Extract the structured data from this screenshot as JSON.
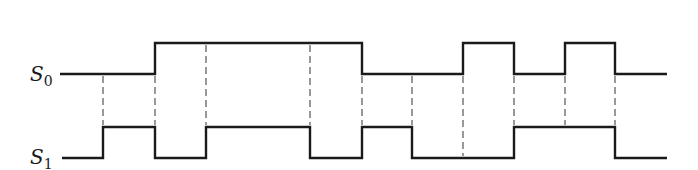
{
  "diagram": {
    "title": "",
    "type": "timing-diagram",
    "colors": {
      "line": "#1a1a1a",
      "dash": "#555555",
      "background": "#ffffff"
    },
    "signals": [
      {
        "id": "s0",
        "label_main": "S",
        "label_sub": "0",
        "y_high": 43,
        "y_low": 74,
        "x_start": 60,
        "x_end": 667,
        "segments": [
          {
            "from": 60,
            "to": 155,
            "level": "low"
          },
          {
            "from": 155,
            "to": 362,
            "level": "high"
          },
          {
            "from": 362,
            "to": 463,
            "level": "low"
          },
          {
            "from": 463,
            "to": 514,
            "level": "high"
          },
          {
            "from": 514,
            "to": 565,
            "level": "low"
          },
          {
            "from": 565,
            "to": 615,
            "level": "high"
          },
          {
            "from": 615,
            "to": 667,
            "level": "low"
          }
        ]
      },
      {
        "id": "s1",
        "label_main": "S",
        "label_sub": "1",
        "y_high": 127,
        "y_low": 158,
        "x_start": 62,
        "x_end": 667,
        "segments": [
          {
            "from": 62,
            "to": 103,
            "level": "low"
          },
          {
            "from": 103,
            "to": 155,
            "level": "high"
          },
          {
            "from": 155,
            "to": 206,
            "level": "low"
          },
          {
            "from": 206,
            "to": 310,
            "level": "high"
          },
          {
            "from": 310,
            "to": 362,
            "level": "low"
          },
          {
            "from": 362,
            "to": 412,
            "level": "high"
          },
          {
            "from": 412,
            "to": 514,
            "level": "low"
          },
          {
            "from": 514,
            "to": 615,
            "level": "high"
          },
          {
            "from": 615,
            "to": 667,
            "level": "low"
          }
        ]
      }
    ],
    "guides_x": [
      103,
      155,
      206,
      310,
      362,
      412,
      463,
      514,
      565,
      615
    ]
  }
}
